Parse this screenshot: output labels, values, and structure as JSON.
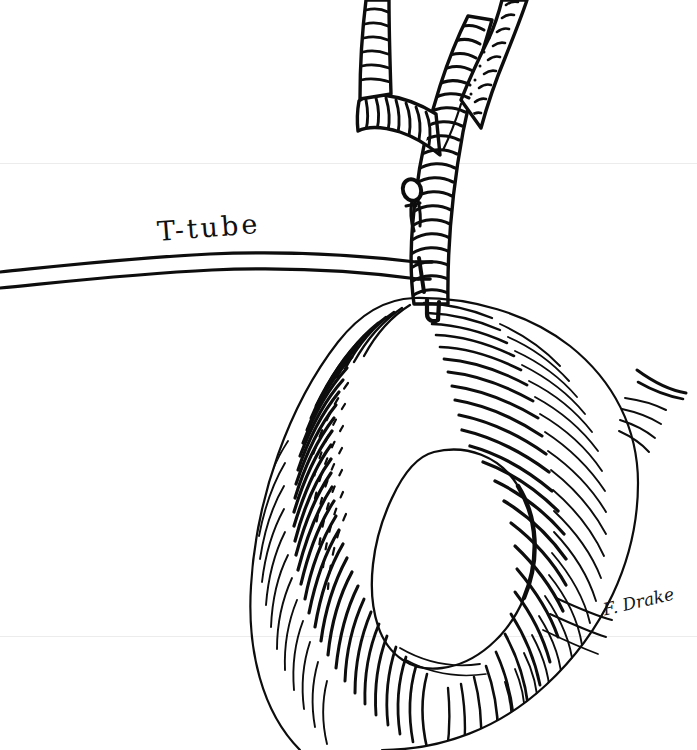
{
  "figure": {
    "domain": "medical-line-illustration",
    "technique": "pen-and-ink hatched line drawing",
    "background_color": "#ffffff",
    "ink_color": "#0d0d0d",
    "width": 697,
    "height": 750
  },
  "labels": {
    "ttube": "T-tube"
  },
  "signature": {
    "artist": "F. Drake"
  },
  "anatomy": {
    "bile_duct": {
      "name": "common bile duct",
      "branches": [
        "left hepatic duct",
        "right hepatic duct"
      ],
      "shading": "transverse hatch bands and stipple"
    },
    "duodenum": {
      "name": "duodenum",
      "shape": "C-loop",
      "shading": "dense radial hatching"
    },
    "suture_knot": {
      "name": "suture knot",
      "location": "bile duct wall above tube entry"
    },
    "closure_stitch": {
      "name": "closure stitch",
      "location": "duct-duodenum junction"
    }
  },
  "tube": {
    "name": "T-tube drain",
    "limb": "horizontal limb exiting left edge of frame"
  },
  "scan_artifacts": {
    "seam_top_y": 163,
    "seam_bottom_y": 636,
    "seam_color": "#ececec"
  }
}
